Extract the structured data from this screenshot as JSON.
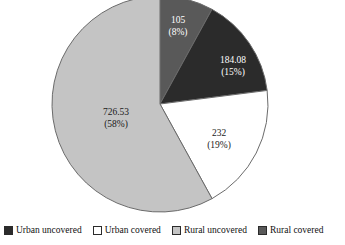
{
  "chart_data": {
    "type": "pie",
    "title": "",
    "subtitle": "",
    "xlabel": "",
    "ylabel": "",
    "legend_position": "bottom",
    "grid": false,
    "start_angle_deg": 0,
    "direction": "clockwise",
    "categories": [
      "Rural covered",
      "Urban uncovered",
      "Urban covered",
      "Rural uncovered"
    ],
    "values": [
      105,
      184.08,
      232,
      726.53
    ],
    "percents": [
      8,
      15,
      19,
      58
    ],
    "colors": [
      "#595959",
      "#2b2b2b",
      "#ffffff",
      "#c4c4c4"
    ],
    "slices": [
      {
        "name": "Rural covered",
        "value": 105,
        "percent": 8,
        "value_label": "105",
        "percent_label": "(8%)",
        "color": "#595959",
        "label_color": "light",
        "label_x": 178,
        "label_y": 21
      },
      {
        "name": "Urban uncovered",
        "value": 184.08,
        "percent": 15,
        "value_label": "184.08",
        "percent_label": "(15%)",
        "color": "#2b2b2b",
        "label_color": "light",
        "label_x": 233,
        "label_y": 61
      },
      {
        "name": "Urban covered",
        "value": 232,
        "percent": 19,
        "value_label": "232",
        "percent_label": "(19%)",
        "color": "#ffffff",
        "label_color": "dark",
        "label_x": 219,
        "label_y": 134
      },
      {
        "name": "Rural uncovered",
        "value": 726.53,
        "percent": 58,
        "value_label": "726.53",
        "percent_label": "(58%)",
        "color": "#c4c4c4",
        "label_color": "dark",
        "label_x": 116,
        "label_y": 113
      }
    ]
  },
  "legend": {
    "items": [
      {
        "label": "Urban uncovered",
        "color": "#2b2b2b"
      },
      {
        "label": "Urban covered",
        "color": "#ffffff"
      },
      {
        "label": "Rural uncovered",
        "color": "#c4c4c4"
      },
      {
        "label": "Rural covered",
        "color": "#595959"
      }
    ]
  },
  "geometry": {
    "center_x": 160,
    "center_y": 104,
    "radius": 108,
    "outline_color": "#6b6b6b"
  }
}
